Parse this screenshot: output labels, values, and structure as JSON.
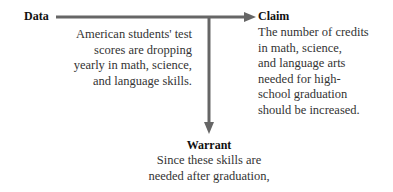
{
  "diagram": {
    "data": {
      "label": "Data",
      "lines": [
        "American students' test",
        "scores are dropping",
        "yearly in math, science,",
        "and language skills."
      ]
    },
    "claim": {
      "label": "Claim",
      "lines": [
        "The number of credits",
        "in math, science,",
        "and language arts",
        "needed for high-",
        "school graduation",
        "should be increased."
      ]
    },
    "warrant": {
      "label": "Warrant",
      "lines": [
        "Since these skills are",
        "needed after graduation,"
      ]
    },
    "colors": {
      "arrow": "#666666",
      "text": "#333333"
    }
  }
}
